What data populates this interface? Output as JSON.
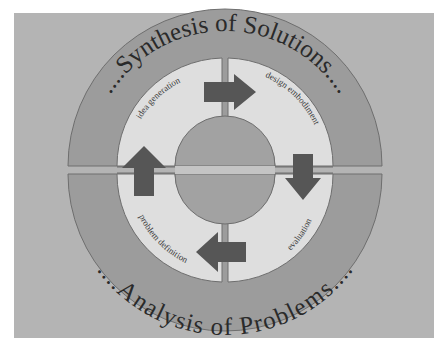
{
  "diagram": {
    "top_label": "....Synthesis of Solutions....",
    "bottom_label": "....Analysis of Problems....",
    "stages": [
      {
        "label": "idea generation",
        "quadrant": "top-left"
      },
      {
        "label": "design embodiment",
        "quadrant": "top-right"
      },
      {
        "label": "evaluation",
        "quadrant": "bottom-right"
      },
      {
        "label": "problem definition",
        "quadrant": "bottom-left"
      }
    ],
    "arrows": [
      {
        "from": "idea generation",
        "to": "design embodiment",
        "direction": "right"
      },
      {
        "from": "design embodiment",
        "to": "evaluation",
        "direction": "down"
      },
      {
        "from": "evaluation",
        "to": "problem definition",
        "direction": "left"
      },
      {
        "from": "problem definition",
        "to": "idea generation",
        "direction": "up"
      }
    ],
    "colors": {
      "background": "#b4b4b4",
      "outer_ring": "#9c9c9c",
      "inner_ring": "#dedede",
      "center": "#a2a2a2",
      "arrow": "#565656",
      "outline": "#6e6e6e"
    }
  }
}
